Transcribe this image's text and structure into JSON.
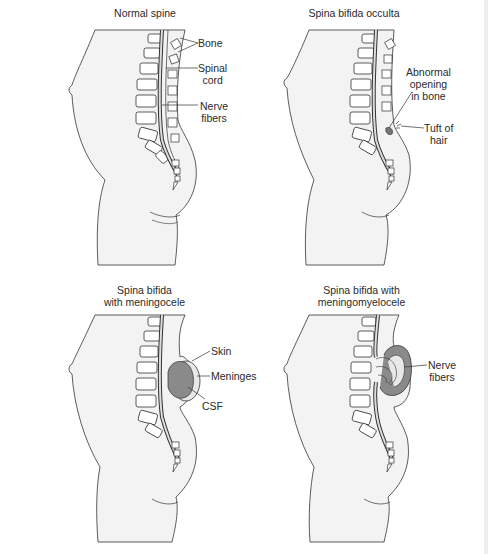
{
  "colors": {
    "body_fill": "#f3f3f3",
    "line": "#333333",
    "meninges_fill": "#8a8a8a",
    "skin_fill": "#e8e8e8",
    "background": "#ffffff"
  },
  "panels": [
    {
      "title": "Normal spine",
      "labels": [
        {
          "text": "Bone"
        },
        {
          "line1": "Spinal",
          "line2": "cord"
        },
        {
          "line1": "Nerve",
          "line2": "fibers"
        }
      ]
    },
    {
      "title": "Spina bifida occulta",
      "labels": [
        {
          "line1": "Abnormal",
          "line2": "opening",
          "line3": "in bone"
        },
        {
          "line1": "Tuft of",
          "line2": "hair"
        }
      ]
    },
    {
      "title_line1": "Spina bifida",
      "title_line2": "with meningocele",
      "labels": [
        {
          "text": "Skin"
        },
        {
          "text": "Meninges"
        },
        {
          "text": "CSF"
        }
      ]
    },
    {
      "title_line1": "Spina bifida with",
      "title_line2": "meningomyelocele",
      "labels": [
        {
          "line1": "Nerve",
          "line2": "fibers"
        }
      ]
    }
  ]
}
